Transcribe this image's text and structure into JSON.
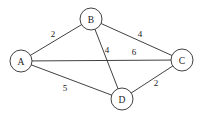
{
  "figure": {
    "name": "weighted-undirected-graph",
    "background_color": "#ffffff",
    "stroke_color": "#2b2b2b",
    "text_color": "#1a1a1a",
    "width": 204,
    "height": 123
  },
  "chart_data": {
    "type": "diagram",
    "diagram_type": "weighted-undirected-graph",
    "title": "",
    "directed": false,
    "nodes": [
      {
        "id": "A",
        "label": "A",
        "x": 21,
        "y": 61,
        "r": 11
      },
      {
        "id": "B",
        "label": "B",
        "x": 91,
        "y": 19,
        "r": 11
      },
      {
        "id": "C",
        "label": "C",
        "x": 182,
        "y": 60,
        "r": 11
      },
      {
        "id": "D",
        "label": "D",
        "x": 122,
        "y": 99,
        "r": 11
      }
    ],
    "edges": [
      {
        "id": "A-B",
        "source": "A",
        "target": "B",
        "weight": 2,
        "label_x": 53,
        "label_y": 34
      },
      {
        "id": "B-C",
        "source": "B",
        "target": "C",
        "weight": 4,
        "label_x": 140,
        "label_y": 34
      },
      {
        "id": "B-D",
        "source": "B",
        "target": "D",
        "weight": 4,
        "label_x": 107,
        "label_y": 50
      },
      {
        "id": "A-C",
        "source": "A",
        "target": "C",
        "weight": 6,
        "label_x": 134,
        "label_y": 52
      },
      {
        "id": "A-D",
        "source": "A",
        "target": "D",
        "weight": 5,
        "label_x": 65,
        "label_y": 88
      },
      {
        "id": "D-C",
        "source": "D",
        "target": "C",
        "weight": 2,
        "label_x": 156,
        "label_y": 83
      }
    ]
  }
}
